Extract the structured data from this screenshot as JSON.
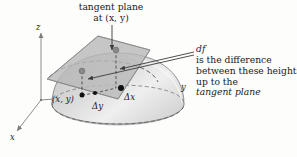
{
  "figure": {
    "title_line1": "tangent plane",
    "title_line2": "at (x, y)",
    "note": {
      "line1_italic": "df",
      "line1_rest": " is the difference",
      "line2": "between these heights",
      "line3_pre": "up to the ",
      "line3_italic": "tangent plane"
    },
    "axes": {
      "z_label": "z",
      "y_label": "y",
      "x_label": "x"
    },
    "points": {
      "base_point_label": "(x, y)",
      "delta_y_label": "Δy",
      "delta_x_label": "Δx"
    },
    "colors": {
      "plane_fill": "#b9b9b9",
      "plane_stroke": "#4a4a4a",
      "dome_fill_light": "#f2f2f2",
      "dome_fill_dark": "#c9c9c9",
      "dome_stroke": "#6f6f6f",
      "dashed_stroke": "#5e5e5e",
      "axis_stroke": "#8d8d8d",
      "dot_black": "#111111",
      "dot_gray": "#8a8a8a",
      "background": "#fdfdfc"
    }
  }
}
